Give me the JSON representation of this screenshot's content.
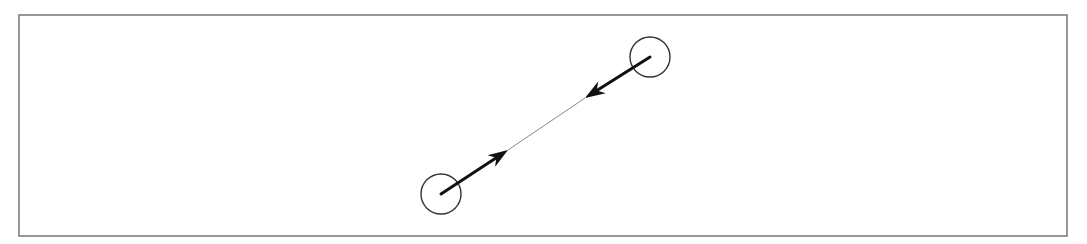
{
  "diagram": {
    "type": "two-body interaction",
    "frame": {
      "x": 19,
      "y": 15,
      "width": 1048,
      "height": 221,
      "stroke": "#777777"
    },
    "nodes": [
      {
        "id": "body-a",
        "cx": 441,
        "cy": 194,
        "r": 20
      },
      {
        "id": "body-b",
        "cx": 650,
        "cy": 57,
        "r": 20
      }
    ],
    "arrows": [
      {
        "id": "force-a-to-b",
        "from": [
          441,
          194
        ],
        "to": [
          508,
          150
        ]
      },
      {
        "id": "force-b-to-a",
        "from": [
          650,
          57
        ],
        "to": [
          585,
          98
        ]
      }
    ],
    "connector": {
      "from": [
        508,
        150
      ],
      "to": [
        585,
        98
      ],
      "stroke": "#888888"
    },
    "colors": {
      "ink": "#111111",
      "circle": "#333333"
    }
  }
}
